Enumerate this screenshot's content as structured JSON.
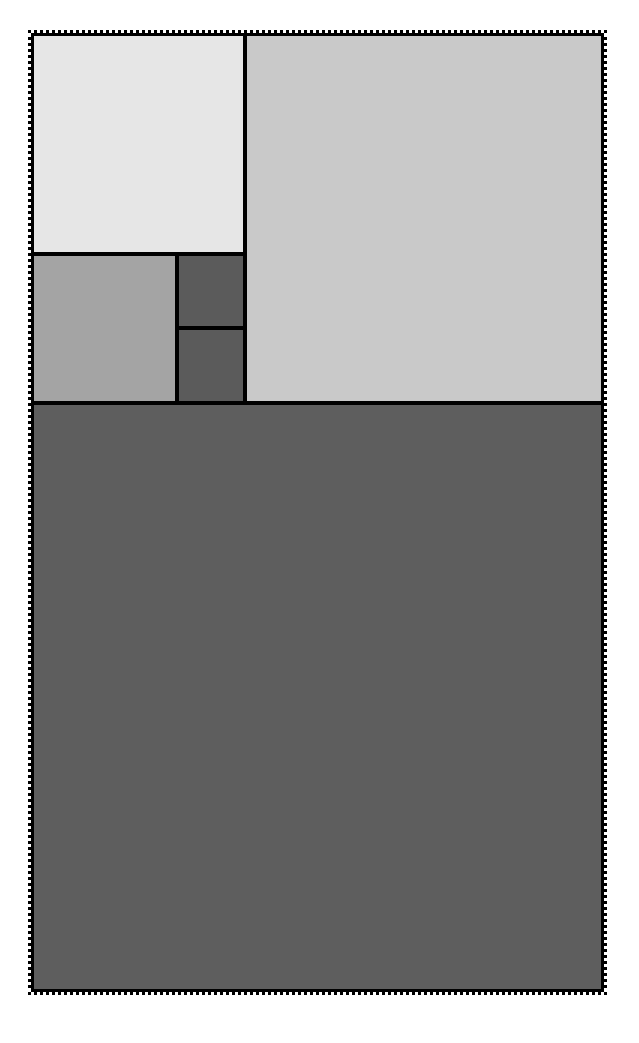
{
  "diagram": {
    "type": "fibonacci-rectangle-tiling",
    "frame": {
      "style": "dotted",
      "color": "#000000"
    },
    "divider_color": "#000000",
    "tiles": [
      {
        "id": "top-left-square",
        "x": 3,
        "y": 3,
        "w": 209,
        "h": 216,
        "color": "#e6e6e6"
      },
      {
        "id": "top-right-square",
        "x": 216,
        "y": 3,
        "w": 354,
        "h": 365,
        "color": "#c9c9c9"
      },
      {
        "id": "mid-left-square",
        "x": 3,
        "y": 223,
        "w": 141,
        "h": 145,
        "color": "#a4a4a4"
      },
      {
        "id": "small-upper-square",
        "x": 148,
        "y": 223,
        "w": 64,
        "h": 70,
        "color": "#5b5b5b"
      },
      {
        "id": "small-lower-square",
        "x": 148,
        "y": 297,
        "w": 64,
        "h": 71,
        "color": "#5b5b5b"
      },
      {
        "id": "bottom-square",
        "x": 3,
        "y": 372,
        "w": 567,
        "h": 584,
        "color": "#5e5e5e"
      }
    ]
  }
}
